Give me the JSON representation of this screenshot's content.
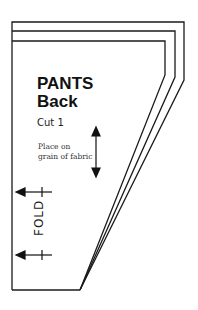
{
  "pattern": {
    "title_line1": "PANTS",
    "title_line2": "Back",
    "cut_instruction": "Cut 1",
    "grain_line1": "Place on",
    "grain_line2": "grain of fabric",
    "fold_label": "FOLD",
    "stroke_color": "#1a1a1a"
  }
}
